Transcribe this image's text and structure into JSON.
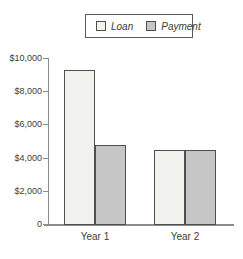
{
  "figure": {
    "background_color": "#ffffff",
    "text_color": "#3d3d3d",
    "axis_color": "#8c8c8c",
    "bar_border_color": "#4f4f4f"
  },
  "legend": {
    "position": "top-center",
    "border_color": "#5a5a5a",
    "items": [
      {
        "label": "Loan",
        "swatch_color": "#f2f2ef"
      },
      {
        "label": "Payment",
        "swatch_color": "#c6c6c6"
      }
    ]
  },
  "chart_data": {
    "type": "bar",
    "title": "",
    "xlabel": "",
    "ylabel": "",
    "categories": [
      "Year 1",
      "Year 2"
    ],
    "series": [
      {
        "name": "Loan",
        "color": "#f2f2ef",
        "values": [
          9250,
          4450
        ]
      },
      {
        "name": "Payment",
        "color": "#c6c6c6",
        "values": [
          4750,
          4450
        ]
      }
    ],
    "ylim": [
      0,
      10000
    ],
    "y_tick_interval": 2000,
    "y_tick_labels": [
      "0",
      "$2,000",
      "$4,000",
      "$6,000",
      "$8,000",
      "$10,000"
    ],
    "grid": false,
    "legend_position": "top-center"
  }
}
